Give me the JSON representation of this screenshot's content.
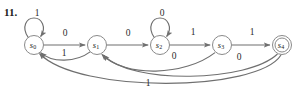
{
  "figure": {
    "exercise_number": "11.",
    "type": "finite-state-automaton-diagram",
    "stroke_color": "#6f6f6f",
    "node_stroke_color": "#8a8a8a",
    "background_color": "#ffffff",
    "states": [
      {
        "id": "s0",
        "base": "s",
        "sub": "0",
        "cx": 34,
        "cy": 45,
        "r": 9.5,
        "accepting": false
      },
      {
        "id": "s1",
        "base": "s",
        "sub": "1",
        "cx": 97,
        "cy": 45,
        "r": 9.5,
        "accepting": false
      },
      {
        "id": "s2",
        "base": "s",
        "sub": "2",
        "cx": 160,
        "cy": 45,
        "r": 9.5,
        "accepting": false
      },
      {
        "id": "s3",
        "base": "s",
        "sub": "3",
        "cx": 222,
        "cy": 45,
        "r": 9.5,
        "accepting": false
      },
      {
        "id": "s4",
        "base": "s",
        "sub": "4",
        "cx": 282,
        "cy": 45,
        "r": 9.5,
        "accepting": true
      }
    ],
    "transitions": [
      {
        "from": "s0",
        "to": "s0",
        "label": "1",
        "kind": "self-loop-top",
        "label_x": 37,
        "label_y": 14
      },
      {
        "from": "s0",
        "to": "s1",
        "label": "0",
        "kind": "straight",
        "label_x": 65,
        "label_y": 34
      },
      {
        "from": "s1",
        "to": "s0",
        "label": "1",
        "kind": "curve-back-short",
        "label_x": 64,
        "label_y": 54
      },
      {
        "from": "s1",
        "to": "s2",
        "label": "0",
        "kind": "straight",
        "label_x": 128,
        "label_y": 34
      },
      {
        "from": "s2",
        "to": "s2",
        "label": "0",
        "kind": "self-loop-top",
        "label_x": 162,
        "label_y": 14
      },
      {
        "from": "s2",
        "to": "s3",
        "label": "1",
        "kind": "straight",
        "label_x": 193,
        "label_y": 33
      },
      {
        "from": "s3",
        "to": "s1",
        "label": "0",
        "kind": "curve-back-long",
        "label_x": 174,
        "label_y": 57
      },
      {
        "from": "s3",
        "to": "s4",
        "label": "1",
        "kind": "straight",
        "label_x": 252,
        "label_y": 33
      },
      {
        "from": "s4",
        "to": "s1",
        "label": "0",
        "kind": "curve-back-long",
        "label_x": 239,
        "label_y": 58
      },
      {
        "from": "s4",
        "to": "s0",
        "label": "1",
        "kind": "curve-back-longest",
        "label_x": 148,
        "label_y": 84
      }
    ],
    "alphabet": [
      "0",
      "1"
    ],
    "start_state": "s0",
    "accepting_states": [
      "s4"
    ]
  }
}
